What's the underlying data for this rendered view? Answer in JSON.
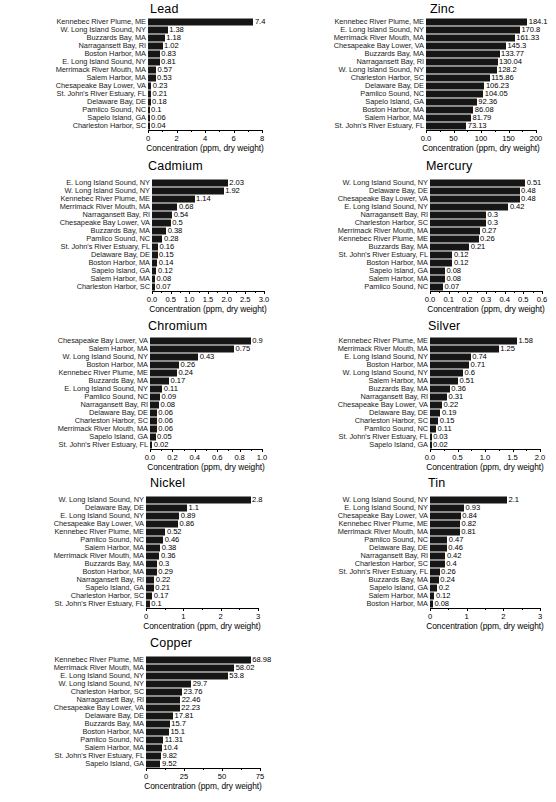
{
  "figure": {
    "axis_title": "Concentration (ppm, dry weight)",
    "bar_color": "#161616",
    "axis_color": "#000000"
  },
  "chart_data": [
    {
      "type": "bar",
      "orientation": "horizontal",
      "title": "Lead",
      "xlabel": "Concentration (ppm, dry weight)",
      "ylabel": "",
      "xlim": [
        0,
        8
      ],
      "ticks": [
        "0",
        "2",
        "4",
        "6",
        "8"
      ],
      "tickvals": [
        0,
        2,
        4,
        6,
        8
      ],
      "grid": false,
      "legend": "none",
      "categories": [
        "Kennebec River Plume, ME",
        "W. Long Island Sound, NY",
        "Buzzards Bay, MA",
        "Narragansett Bay, RI",
        "Boston Harbor, MA",
        "E. Long Island Sound, NY",
        "Merrimack River Mouth, MA",
        "Salem Harbor, MA",
        "Chesapeake Bay Lower, VA",
        "St. John's River Estuary, FL",
        "Delaware Bay, DE",
        "Pamlico Sound, NC",
        "Sapelo Island, GA",
        "Charleston Harbor, SC"
      ],
      "values": [
        7.4,
        1.38,
        1.18,
        1.02,
        0.83,
        0.81,
        0.57,
        0.53,
        0.23,
        0.21,
        0.18,
        0.1,
        0.06,
        0.04
      ],
      "labels": [
        "7.4",
        "1.38",
        "1.18",
        "1.02",
        "0.83",
        "0.81",
        "0.57",
        "0.53",
        "0.23",
        "0.21",
        "0.18",
        "0.1",
        "0.06",
        "0.04"
      ]
    },
    {
      "type": "bar",
      "orientation": "horizontal",
      "title": "Zinc",
      "xlabel": "Concentration (ppm, dry weight)",
      "ylabel": "",
      "xlim": [
        0,
        200
      ],
      "ticks": [
        "0.0",
        "50",
        "100",
        "150",
        "200"
      ],
      "tickvals": [
        0,
        50,
        100,
        150,
        200
      ],
      "grid": false,
      "legend": "none",
      "categories": [
        "Kennebec River Plume, ME",
        "E. Long Island Sound, NY",
        "Merrimack River Mouth, MA",
        "Chesapeake Bay Lower, VA",
        "Buzzards Bay, MA",
        "Narragansett Bay, RI",
        "W. Long Island Sound, NY",
        "Charleston Harbor, SC",
        "Delaware Bay, DE",
        "Pamlico Sound, NC",
        "Sapelo Island, GA",
        "Boston Harbor, MA",
        "Salem Harbor, MA",
        "St. John's River Estuary, FL"
      ],
      "values": [
        184.1,
        170.8,
        161.33,
        145.3,
        133.77,
        130.04,
        128.2,
        115.86,
        106.23,
        104.05,
        92.36,
        86.08,
        81.79,
        73.13
      ],
      "labels": [
        "184.1",
        "170.8",
        "161.33",
        "145.3",
        "133.77",
        "130.04",
        "128.2",
        "115.86",
        "106.23",
        "104.05",
        "92.36",
        "86.08",
        "81.79",
        "73.13"
      ]
    },
    {
      "type": "bar",
      "orientation": "horizontal",
      "title": "Cadmium",
      "xlabel": "Concentration (ppm, dry weight)",
      "ylabel": "",
      "xlim": [
        0,
        3
      ],
      "ticks": [
        "0.0",
        "0.5",
        "1.0",
        "1.5",
        "2.0",
        "2.5",
        "3.0"
      ],
      "tickvals": [
        0,
        0.5,
        1.0,
        1.5,
        2.0,
        2.5,
        3.0
      ],
      "grid": false,
      "legend": "none",
      "categories": [
        "E. Long Island Sound, NY",
        "W. Long Island Sound, NY",
        "Kennebec River Plume, ME",
        "Merrimack River Mouth, MA",
        "Narragansett Bay, RI",
        "Chesapeake Bay Lower, VA",
        "Buzzards Bay, MA",
        "Pamlico Sound, NC",
        "St. John's River Estuary, FL",
        "Delaware Bay, DE",
        "Boston Harbor, MA",
        "Sapelo Island, GA",
        "Salem Harbor, MA",
        "Charleston Harbor, SC"
      ],
      "values": [
        2.03,
        1.92,
        1.14,
        0.68,
        0.54,
        0.5,
        0.38,
        0.28,
        0.16,
        0.15,
        0.14,
        0.12,
        0.08,
        0.07
      ],
      "labels": [
        "2.03",
        "1.92",
        "1.14",
        "0.68",
        "0.54",
        "0.5",
        "0.38",
        "0.28",
        "0.16",
        "0.15",
        "0.14",
        "0.12",
        "0.08",
        "0.07"
      ]
    },
    {
      "type": "bar",
      "orientation": "horizontal",
      "title": "Mercury",
      "xlabel": "Concentration (ppm, dry weight)",
      "ylabel": "",
      "xlim": [
        0,
        0.6
      ],
      "ticks": [
        "0.0",
        "0.1",
        "0.2",
        "0.3",
        "0.4",
        "0.5",
        "0.6"
      ],
      "tickvals": [
        0,
        0.1,
        0.2,
        0.3,
        0.4,
        0.5,
        0.6
      ],
      "grid": false,
      "legend": "none",
      "categories": [
        "W. Long Island Sound, NY",
        "Delaware Bay, DE",
        "Chesapeake Bay Lower, VA",
        "E. Long Island Sound, NY",
        "Narragansett Bay, RI",
        "Charleston Harbor, SC",
        "Merrimack River Mouth, MA",
        "Kennebec River Plume, ME",
        "Buzzards Bay, MA",
        "St. John's River Estuary, FL",
        "Boston Harbor, MA",
        "Sapelo Island, GA",
        "Salem Harbor, MA",
        "Pamlico Sound, NC"
      ],
      "values": [
        0.51,
        0.48,
        0.48,
        0.42,
        0.3,
        0.3,
        0.27,
        0.26,
        0.21,
        0.12,
        0.12,
        0.08,
        0.08,
        0.07
      ],
      "labels": [
        "0.51",
        "0.48",
        "0.48",
        "0.42",
        "0.3",
        "0.3",
        "0.27",
        "0.26",
        "0.21",
        "0.12",
        "0.12",
        "0.08",
        "0.08",
        "0.07"
      ]
    },
    {
      "type": "bar",
      "orientation": "horizontal",
      "title": "Chromium",
      "xlabel": "Concentration (ppm, dry weight)",
      "ylabel": "",
      "xlim": [
        0,
        1.0
      ],
      "ticks": [
        "0.0",
        "0.2",
        "0.4",
        "0.6",
        "0.8",
        "1.0"
      ],
      "tickvals": [
        0,
        0.2,
        0.4,
        0.6,
        0.8,
        1.0
      ],
      "grid": false,
      "legend": "none",
      "categories": [
        "Chesapeake Bay Lower, VA",
        "Salem Harbor, MA",
        "W. Long Island Sound, NY",
        "Boston Harbor, MA",
        "Kennebec River Plume, ME",
        "Buzzards Bay, MA",
        "E. Long Island Sound, NY",
        "Pamlico Sound, NC",
        "Narragansett Bay, RI",
        "Delaware Bay, DE",
        "Charleston Harbor, SC",
        "Merrimack River Mouth, MA",
        "Sapelo Island, GA",
        "St. John's River Estuary, FL"
      ],
      "values": [
        0.9,
        0.75,
        0.43,
        0.26,
        0.24,
        0.17,
        0.11,
        0.09,
        0.08,
        0.06,
        0.06,
        0.06,
        0.05,
        0.02
      ],
      "labels": [
        "0.9",
        "0.75",
        "0.43",
        "0.26",
        "0.24",
        "0.17",
        "0.11",
        "0.09",
        "0.08",
        "0.06",
        "0.06",
        "0.06",
        "0.05",
        "0.02"
      ]
    },
    {
      "type": "bar",
      "orientation": "horizontal",
      "title": "Silver",
      "xlabel": "Concentration (ppm, dry weight)",
      "ylabel": "",
      "xlim": [
        0,
        2.0
      ],
      "ticks": [
        "0.0",
        "0.5",
        "1.0",
        "1.5",
        "2.0"
      ],
      "tickvals": [
        0,
        0.5,
        1.0,
        1.5,
        2.0
      ],
      "grid": false,
      "legend": "none",
      "categories": [
        "Kennebec River Plume, ME",
        "Merrimack River Mouth, MA",
        "E. Long Island Sound, NY",
        "Boston Harbor, MA",
        "W. Long Island Sound, NY",
        "Salem Harbor, MA",
        "Buzzards Bay, MA",
        "Narragansett Bay, RI",
        "Chesapeake Bay Lower, VA",
        "Delaware Bay, DE",
        "Charleston Harbor, SC",
        "Pamlico Sound, NC",
        "St. John's River Estuary, FL",
        "Sapelo Island, GA"
      ],
      "values": [
        1.58,
        1.25,
        0.74,
        0.71,
        0.6,
        0.51,
        0.36,
        0.31,
        0.22,
        0.19,
        0.15,
        0.11,
        0.03,
        0.02
      ],
      "labels": [
        "1.58",
        "1.25",
        "0.74",
        "0.71",
        "0.6",
        "0.51",
        "0.36",
        "0.31",
        "0.22",
        "0.19",
        "0.15",
        "0.11",
        "0.03",
        "0.02"
      ]
    },
    {
      "type": "bar",
      "orientation": "horizontal",
      "title": "Nickel",
      "xlabel": "Concentration (ppm, dry weight)",
      "ylabel": "",
      "xlim": [
        0,
        3
      ],
      "ticks": [
        "0",
        "1",
        "2",
        "3"
      ],
      "tickvals": [
        0,
        1,
        2,
        3
      ],
      "grid": false,
      "legend": "none",
      "categories": [
        "W. Long Island Sound, NY",
        "Delaware Bay, DE",
        "E. Long Island Sound, NY",
        "Chesapeake Bay Lower, VA",
        "Kennebec River Plume, ME",
        "Pamlico Sound, NC",
        "Salem Harbor, MA",
        "Merrimack River Mouth, MA",
        "Buzzards Bay, MA",
        "Boston Harbor, MA",
        "Narragansett Bay, RI",
        "Sapelo Island, GA",
        "Charleston Harbor, SC",
        "St. John's River Estuary, FL"
      ],
      "values": [
        2.8,
        1.1,
        0.89,
        0.86,
        0.52,
        0.46,
        0.38,
        0.36,
        0.3,
        0.29,
        0.22,
        0.21,
        0.17,
        0.1
      ],
      "labels": [
        "2.8",
        "1.1",
        "0.89",
        "0.86",
        "0.52",
        "0.46",
        "0.38",
        "0.36",
        "0.3",
        "0.29",
        "0.22",
        "0.21",
        "0.17",
        "0.1"
      ]
    },
    {
      "type": "bar",
      "orientation": "horizontal",
      "title": "Tin",
      "xlabel": "Concentration (ppm, dry weight)",
      "ylabel": "",
      "xlim": [
        0,
        3
      ],
      "ticks": [
        "0",
        "1",
        "2",
        "3"
      ],
      "tickvals": [
        0,
        1,
        2,
        3
      ],
      "grid": false,
      "legend": "none",
      "categories": [
        "W. Long Island Sound, NY",
        "E. Long Island Sound, NY",
        "Chesapeake Bay Lower, VA",
        "Kennebec River Plume, ME",
        "Merrimack River Mouth, MA",
        "Pamlico Sound, NC",
        "Delaware Bay, DE",
        "Narragansett Bay, RI",
        "Charleston Harbor, SC",
        "St. John's River Estuary, FL",
        "Buzzards Bay, MA",
        "Sapelo Island, GA",
        "Salem Harbor, MA",
        "Boston Harbor, MA"
      ],
      "values": [
        2.1,
        0.93,
        0.84,
        0.82,
        0.81,
        0.47,
        0.46,
        0.42,
        0.4,
        0.26,
        0.24,
        0.2,
        0.12,
        0.08
      ],
      "labels": [
        "2.1",
        "0.93",
        "0.84",
        "0.82",
        "0.81",
        "0.47",
        "0.46",
        "0.42",
        "0.4",
        "0.26",
        "0.24",
        "0.2",
        "0.12",
        "0.08"
      ]
    },
    {
      "type": "bar",
      "orientation": "horizontal",
      "title": "Copper",
      "xlabel": "Concentration (ppm, dry weight)",
      "ylabel": "",
      "xlim": [
        0,
        75
      ],
      "ticks": [
        "0",
        "25",
        "50",
        "75"
      ],
      "tickvals": [
        0,
        25,
        50,
        75
      ],
      "grid": false,
      "legend": "none",
      "categories": [
        "Kennebec River Plume, ME",
        "Merrimack River Mouth, MA",
        "E. Long Island Sound, NY",
        "W. Long Island Sound, NY",
        "Charleston Harbor, SC",
        "Narragansett Bay, RI",
        "Chesapeake Bay Lower, VA",
        "Delaware Bay, DE",
        "Buzzards Bay, MA",
        "Boston Harbor, MA",
        "Pamlico Sound, NC",
        "Salem Harbor, MA",
        "St. John's River Estuary, FL",
        "Sapelo Island, GA"
      ],
      "values": [
        68.98,
        58.02,
        53.8,
        29.7,
        23.76,
        22.46,
        22.23,
        17.81,
        15.7,
        15.1,
        11.31,
        10.4,
        9.82,
        9.52
      ],
      "labels": [
        "68.98",
        "58.02",
        "53.8",
        "29.7",
        "23.76",
        "22.46",
        "22.23",
        "17.81",
        "15.7",
        "15.1",
        "11.31",
        "10.4",
        "9.82",
        "9.52"
      ]
    }
  ]
}
